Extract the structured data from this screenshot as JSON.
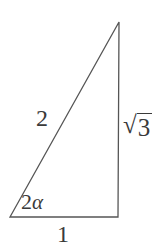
{
  "figure": {
    "kind": "right-triangle-diagram",
    "background_color": "#ffffff",
    "stroke_color": "#555555",
    "text_color": "#3a3a3a",
    "stroke_width": 1.3,
    "vertices": {
      "apex": {
        "x": 119,
        "y": 22
      },
      "bottom_left": {
        "x": 10,
        "y": 217
      },
      "bottom_right": {
        "x": 118,
        "y": 217
      }
    },
    "labels": {
      "hypotenuse": "2",
      "base": "1",
      "angle_number": "2",
      "angle_symbol": "α",
      "vertical_radical": "√",
      "vertical_radicand": "3"
    }
  }
}
